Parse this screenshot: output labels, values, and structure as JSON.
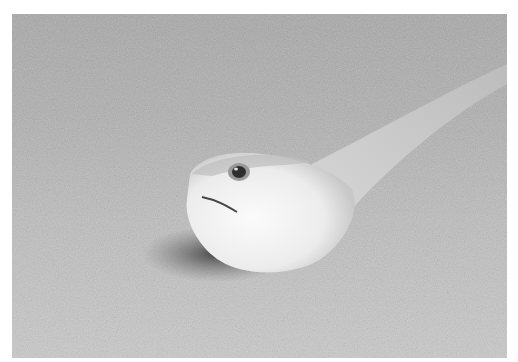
{
  "image": {
    "description": "Grayscale photograph of a fish with a large pale head and glossy eye resting on a sandy seabed, body extending diagonally toward the upper right",
    "subject": "fish on sand",
    "colors": {
      "background": "#ffffff",
      "sand_top": "#a8a8a8",
      "sand_bottom": "#c9c9c9",
      "fish_body": "#e6e6e6",
      "fish_head": "#f4f4f4",
      "shadow": "#4a4a4a"
    }
  }
}
